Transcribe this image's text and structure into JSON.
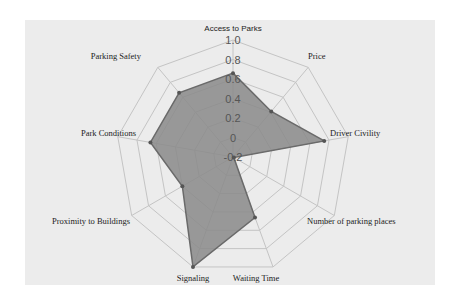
{
  "chart_data": {
    "type": "radar",
    "title": "",
    "axes": [
      "Access to Parks",
      "Price",
      "Driver Civility",
      "Number of parking places",
      "Waiting Time",
      "Signaling",
      "Proximity to Buildings",
      "Park Conditions",
      "Parking Safety"
    ],
    "series": [
      {
        "name": "",
        "values": [
          0.66,
          0.41,
          0.75,
          -0.19,
          0.46,
          1.0,
          0.4,
          0.66,
          0.66
        ]
      }
    ],
    "radial_ticks": [
      "-0.2",
      "0",
      "0.2",
      "0.4",
      "0.6",
      "0.8",
      "1.0"
    ],
    "rlim": [
      -0.2,
      1.0
    ],
    "grid": true,
    "legend": false,
    "colors": {
      "fill": "#8a8a8a",
      "stroke": "#6a6a6a",
      "grid": "#c4c4c4",
      "panel": "#ececec"
    }
  }
}
